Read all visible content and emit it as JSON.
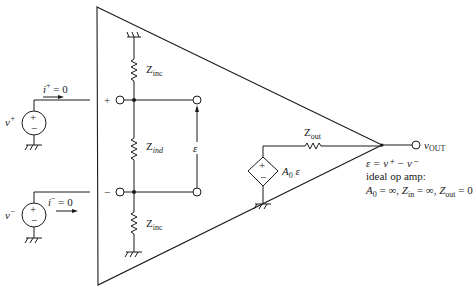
{
  "diagram": {
    "colors": {
      "line": "#1a1a1a",
      "background": "#ffffff"
    },
    "inputs": {
      "plus": {
        "source_label": "v",
        "source_sup": "+",
        "current_label": "i",
        "current_sup": "+",
        "current_value": " = 0",
        "terminal_sign": "+",
        "source_signs": [
          "+",
          "−"
        ]
      },
      "minus": {
        "source_label": "v",
        "source_sup": "−",
        "current_label": "i",
        "current_sup": "−",
        "current_value": " = 0",
        "terminal_sign": "−",
        "source_signs": [
          "+",
          "−"
        ]
      }
    },
    "impedances": {
      "zinc_top": {
        "main": "Z",
        "sub": "inc"
      },
      "zind": {
        "main": "Z",
        "sub": "ind"
      },
      "zinc_bottom": {
        "main": "Z",
        "sub": "inc"
      },
      "zout": {
        "main": "Z",
        "sub": "out"
      }
    },
    "error_voltage": {
      "label": "ε"
    },
    "dependent_source": {
      "gain_main": "A",
      "gain_sub": "0",
      "gain_var": " ε",
      "signs": [
        "+",
        "−"
      ]
    },
    "output": {
      "label": "v",
      "sub": "OUT"
    },
    "notes": {
      "line1": "ε = v⁺ − v⁻",
      "line2": "ideal op amp:",
      "line3_parts": {
        "a": "A",
        "a_sub": "0",
        "a_val": " = ∞, ",
        "zin": "Z",
        "zin_sub": "in",
        "zin_val": " = ∞, ",
        "zout": "Z",
        "zout_sub": "out",
        "zout_val": " = 0"
      }
    }
  }
}
